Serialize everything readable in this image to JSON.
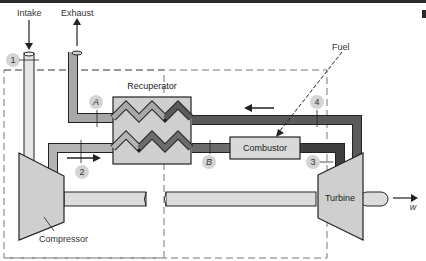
{
  "diagram": {
    "labels": {
      "intake": "Intake",
      "exhaust": "Exhaust",
      "fuel": "Fuel",
      "recuperator": "Recuperator",
      "combustor": "Combustor",
      "compressor": "Compressor",
      "turbine": "Turbine",
      "work": "w"
    },
    "state_points": {
      "p1": "1",
      "p2": "2",
      "p3": "3",
      "p4": "4",
      "pA": "A",
      "pB": "B"
    },
    "colors": {
      "light_pipe": "#d9d9d9",
      "medium_pipe": "#a8a8a8",
      "dark_pipe": "#5a5a5a",
      "component_fill": "#cfcfcf",
      "marker_fill": "#d4d4d4",
      "outline": "#222222",
      "boundary": "#777777"
    }
  }
}
